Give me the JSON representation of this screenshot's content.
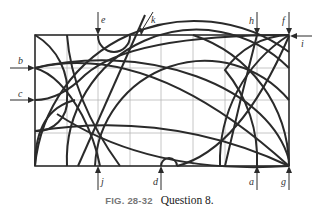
{
  "figure": {
    "caption_label": "FIG. 28-32",
    "caption_text": "Question 8.",
    "grid": {
      "columns": 8,
      "rows": 4
    },
    "labels": {
      "a": "a",
      "b": "b",
      "c": "c",
      "d": "d",
      "e": "e",
      "f": "f",
      "g": "g",
      "h": "h",
      "i": "i",
      "j": "j",
      "k": "k"
    },
    "colors": {
      "line": "#2a2a2a",
      "grid": "#b8b8b8",
      "caption_label": "#777777"
    }
  }
}
